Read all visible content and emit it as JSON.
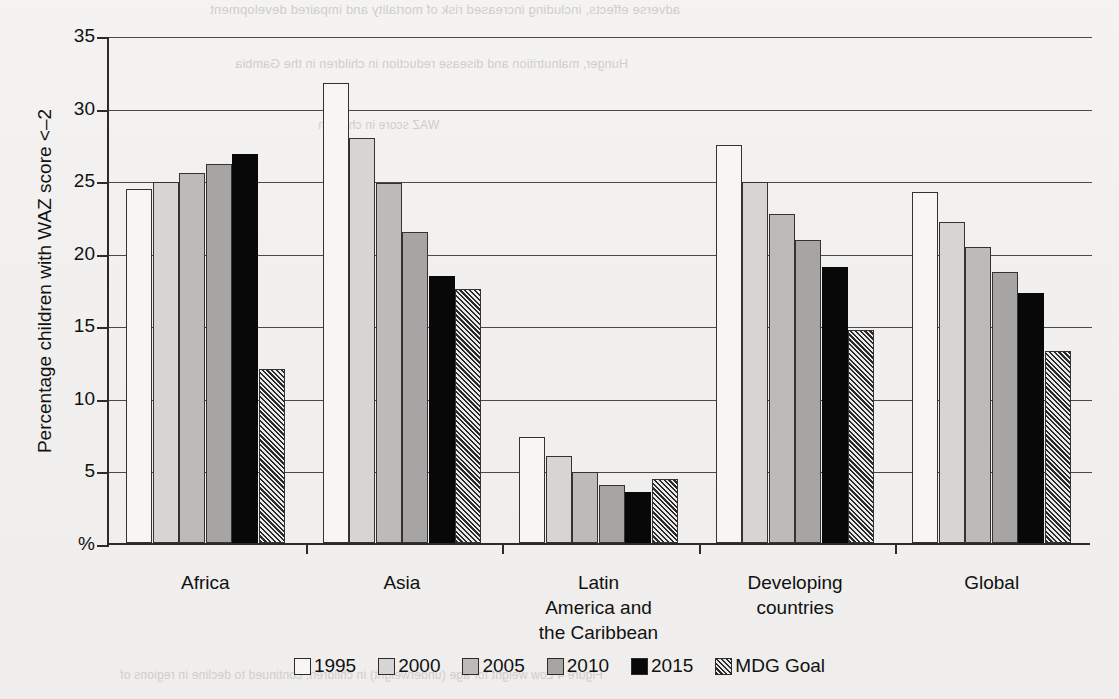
{
  "ghost_text": {
    "line1": "adverse effects, including increased risk of mortality and impaired development",
    "line2": "Hunger, malnutrition and disease reduction in children in the Gambia",
    "line3": "WAZ score in children",
    "line4": "Figure 4  Low weight for age (underweight) in children, continued to decline in regions of"
  },
  "chart_data": {
    "type": "bar",
    "title": "",
    "xlabel": "",
    "ylabel": "Percentage children with WAZ score <–2",
    "ylim": [
      0,
      35
    ],
    "yticks": [
      0,
      5,
      10,
      15,
      20,
      25,
      30,
      35
    ],
    "ytick_labels": [
      "%",
      "5",
      "10",
      "15",
      "20",
      "25",
      "30",
      "35"
    ],
    "grid": true,
    "legend_position": "bottom",
    "categories": [
      "Africa",
      "Asia",
      "Latin\nAmerica and\nthe Caribbean",
      "Developing\ncountries",
      "Global"
    ],
    "category_labels": [
      [
        "Africa"
      ],
      [
        "Asia"
      ],
      [
        "Latin",
        "America and",
        "the Caribbean"
      ],
      [
        "Developing",
        "countries"
      ],
      [
        "Global"
      ]
    ],
    "series": [
      {
        "name": "1995",
        "key": "s1995",
        "color": "#f7f6f4",
        "values": [
          24.4,
          31.7,
          7.3,
          27.4,
          24.2
        ]
      },
      {
        "name": "2000",
        "key": "s2000",
        "color": "#d6d5d3",
        "values": [
          24.9,
          27.9,
          6.0,
          24.9,
          22.1
        ]
      },
      {
        "name": "2005",
        "key": "s2005",
        "color": "#bcbbb9",
        "values": [
          25.5,
          24.8,
          4.9,
          22.7,
          20.4
        ]
      },
      {
        "name": "2010",
        "key": "s2010",
        "color": "#a6a5a3",
        "values": [
          26.1,
          21.4,
          4.0,
          20.9,
          18.7
        ]
      },
      {
        "name": "2015",
        "key": "s2015",
        "color": "#080808",
        "values": [
          26.8,
          18.4,
          3.5,
          19.0,
          17.2
        ]
      },
      {
        "name": "MDG Goal",
        "key": "smdg",
        "color": "hatched",
        "values": [
          12.0,
          17.5,
          4.4,
          14.7,
          13.2
        ]
      }
    ]
  }
}
